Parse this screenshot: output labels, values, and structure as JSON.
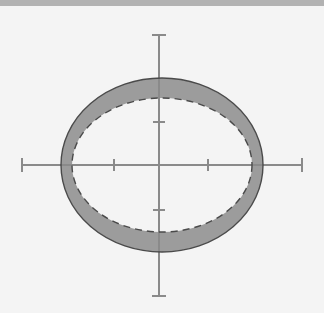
{
  "canvas": {
    "width": 324,
    "height": 313,
    "background_color": "#f4f4f4",
    "page_background_color": "#ffffff"
  },
  "top_bar": {
    "color": "#b2b2b2",
    "height": 6
  },
  "chart_data": {
    "type": "diagram",
    "title": "",
    "subtitle": "",
    "xlabel": "",
    "ylabel": "",
    "grid": false,
    "legend": false,
    "axes": {
      "center": {
        "x": 159,
        "y": 165
      },
      "x_axis": {
        "x_start": 22,
        "x_end": 302,
        "y": 165,
        "color": "#8a8a8a",
        "width": 2
      },
      "y_axis": {
        "y_start": 35,
        "y_end": 296,
        "x": 159,
        "color": "#8a8a8a",
        "width": 2
      },
      "x_ticks": [
        {
          "x": 22,
          "half_length": 7,
          "kind": "end"
        },
        {
          "x": 114,
          "half_length": 6,
          "kind": "minor"
        },
        {
          "x": 208,
          "half_length": 6,
          "kind": "minor"
        },
        {
          "x": 302,
          "half_length": 7,
          "kind": "end"
        }
      ],
      "y_ticks": [
        {
          "y": 35,
          "half_length": 7,
          "kind": "end"
        },
        {
          "y": 122,
          "half_length": 6,
          "kind": "minor"
        },
        {
          "y": 210,
          "half_length": 6,
          "kind": "minor"
        },
        {
          "y": 296,
          "half_length": 7,
          "kind": "end"
        }
      ],
      "tick_labels": []
    },
    "shapes": [
      {
        "name": "outer-solid-ellipse",
        "kind": "ellipse",
        "stroke_style": "solid",
        "cx": 162,
        "cy": 165,
        "rx": 101,
        "ry": 87,
        "stroke": "#4a4a4a",
        "stroke_width": 1.4,
        "fill": "none"
      },
      {
        "name": "inner-dashed-ellipse",
        "kind": "ellipse",
        "stroke_style": "dashed",
        "dash_pattern": "7 5",
        "cx": 162,
        "cy": 165,
        "rx": 90,
        "ry": 67,
        "stroke": "#4a4a4a",
        "stroke_width": 1.4,
        "fill": "none"
      },
      {
        "name": "left-lune-region",
        "kind": "lune",
        "side": "left",
        "fill": "#9c9c9c",
        "stroke": "#4a4a4a",
        "stroke_width": 1.2,
        "opacity": 1
      },
      {
        "name": "right-lune-region",
        "kind": "lune",
        "side": "right",
        "fill": "#9c9c9c",
        "stroke": "#4a4a4a",
        "stroke_width": 1.2,
        "opacity": 1
      }
    ],
    "intersections": [
      {
        "x": 84,
        "y": 118
      },
      {
        "x": 84,
        "y": 212
      },
      {
        "x": 240,
        "y": 118
      },
      {
        "x": 240,
        "y": 212
      }
    ],
    "colors": {
      "lune_fill": "#9c9c9c",
      "curve_stroke": "#4a4a4a",
      "axis_stroke": "#8a8a8a",
      "background": "#f4f4f4",
      "top_bar": "#b2b2b2"
    }
  },
  "annotations": []
}
